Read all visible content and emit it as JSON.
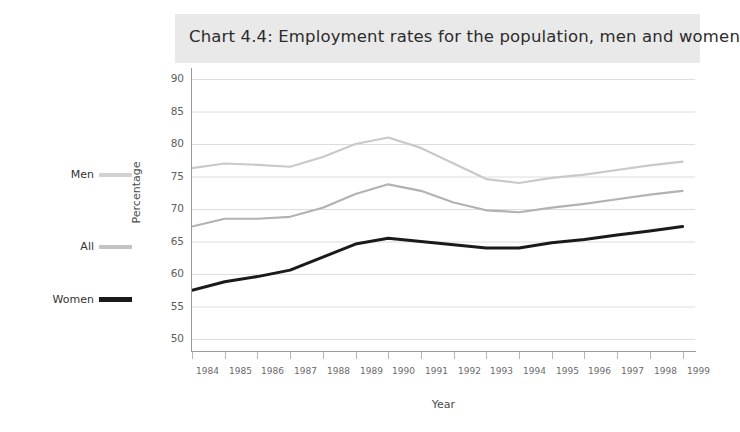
{
  "chart_data": {
    "type": "line",
    "title": "Chart 4.4: Employment rates for the population, men and women",
    "xlabel": "Year",
    "ylabel": "Percentage",
    "ylim": [
      48,
      92
    ],
    "yticks": [
      50,
      55,
      60,
      65,
      70,
      75,
      80,
      85,
      90
    ],
    "grid": true,
    "legend_position": "left",
    "categories": [
      "1984",
      "1985",
      "1986",
      "1987",
      "1988",
      "1989",
      "1990",
      "1991",
      "1992",
      "1993",
      "1994",
      "1995",
      "1996",
      "1997",
      "1998",
      "1999"
    ],
    "x": [
      1984,
      1985,
      1986,
      1987,
      1988,
      1989,
      1990,
      1991,
      1992,
      1993,
      1994,
      1995,
      1996,
      1997,
      1998,
      1999
    ],
    "series": [
      {
        "name": "Men",
        "color": "#c9c9c9",
        "values": [
          76.3,
          77.0,
          76.8,
          76.5,
          78.0,
          80.0,
          81.0,
          79.4,
          77.0,
          74.6,
          74.0,
          74.8,
          75.3,
          76.0,
          76.7,
          77.3
        ]
      },
      {
        "name": "All",
        "color": "#b2b2b2",
        "values": [
          67.3,
          68.5,
          68.5,
          68.8,
          70.2,
          72.3,
          73.8,
          72.8,
          71.0,
          69.8,
          69.5,
          70.2,
          70.8,
          71.5,
          72.2,
          72.8
        ]
      },
      {
        "name": "Women",
        "color": "#1a1a1a",
        "values": [
          57.5,
          58.8,
          59.6,
          60.6,
          62.6,
          64.6,
          65.5,
          65.0,
          64.5,
          64.0,
          64.0,
          64.8,
          65.3,
          66.0,
          66.6,
          67.3
        ]
      }
    ]
  },
  "title_band": {
    "text": "Chart 4.4: Employment rates for the population, men and women",
    "background": "#e9e9e9"
  },
  "axes": {
    "y_label": "Percentage",
    "x_label": "Year",
    "y_ticks": [
      "90",
      "85",
      "80",
      "75",
      "70",
      "65",
      "60",
      "55",
      "50"
    ],
    "x_ticks": [
      "1984",
      "1985",
      "1986",
      "1987",
      "1988",
      "1989",
      "1990",
      "1991",
      "1992",
      "1993",
      "1994",
      "1995",
      "1996",
      "1997",
      "1998",
      "1999"
    ]
  },
  "legend": {
    "items": [
      {
        "label": "Men",
        "color": "#d2d2d2"
      },
      {
        "label": "All",
        "color": "#c3c3c3"
      },
      {
        "label": "Women",
        "color": "#1a1a1a"
      }
    ]
  },
  "colors": {
    "background": "#ffffff",
    "title_band": "#e9e9e9",
    "gridline": "#dcdcdc",
    "axis": "#9a9a9a",
    "men_line": "#c9c9c9",
    "all_line": "#b2b2b2",
    "women_line": "#1a1a1a"
  }
}
